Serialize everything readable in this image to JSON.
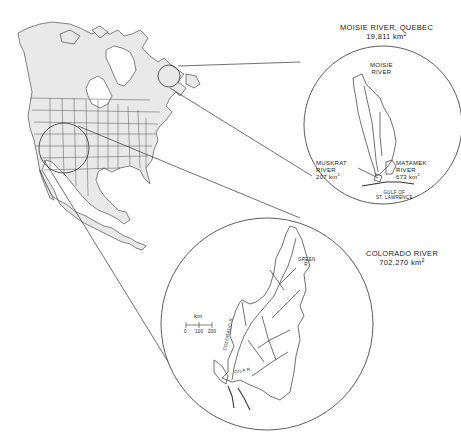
{
  "figure": {
    "type": "map-comparison"
  },
  "insets": {
    "moisie": {
      "title": "MOISIE RIVER, QUEBEC",
      "area_value": "19,811",
      "area_unit": "km",
      "area_exp": "2",
      "labels": {
        "moisie_line1": "MOISIE",
        "moisie_line2": "RIVER",
        "muskrat_line1": "MUSKRAT",
        "muskrat_line2": "RIVER",
        "muskrat_area": "207 km",
        "matamek_line1": "MATAMEK",
        "matamek_line2": "RIVER",
        "matamek_area": "673 km",
        "gulf_line1": "GULF OF",
        "gulf_line2": "ST. LAWRENCE"
      }
    },
    "colorado": {
      "title": "COLORADO RIVER",
      "area_value": "702,270",
      "area_unit": "km",
      "area_exp": "2",
      "labels": {
        "green": "GREEN",
        "green_r": "R.",
        "colorado": "COLORADO R.",
        "gila": "GILA R."
      },
      "scale_bar": {
        "unit": "km",
        "ticks": [
          "0",
          "100",
          "200"
        ]
      }
    }
  },
  "colors": {
    "land": "#e9e9e9",
    "line": "#333333",
    "background": "#ffffff"
  }
}
